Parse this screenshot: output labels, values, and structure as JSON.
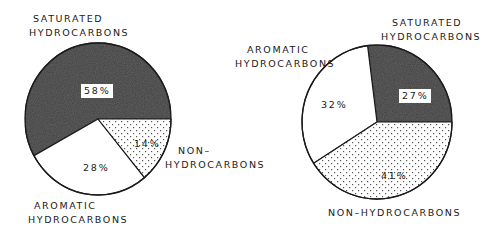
{
  "chart_data": [
    {
      "type": "pie",
      "title": "",
      "categories": [
        "Saturated Hydrocarbons",
        "Aromatic Hydrocarbons",
        "Non-Hydrocarbons"
      ],
      "values": [
        58,
        28,
        14
      ],
      "units": "%",
      "fills": [
        "dark-gray",
        "white",
        "dotted"
      ],
      "labels": {
        "saturated": [
          "SATURATED",
          "HYDROCARBONS"
        ],
        "aromatic": [
          "AROMATIC",
          "HYDROCARBONS"
        ],
        "non": [
          "NON–",
          "HYDROCARBONS"
        ]
      },
      "value_labels": [
        "58%",
        "28%",
        "14%"
      ],
      "legend": "none (direct labels)"
    },
    {
      "type": "pie",
      "title": "",
      "categories": [
        "Saturated Hydrocarbons",
        "Aromatic Hydrocarbons",
        "Non-Hydrocarbons"
      ],
      "values": [
        27,
        32,
        41
      ],
      "units": "%",
      "fills": [
        "dark-gray",
        "white",
        "dotted"
      ],
      "labels": {
        "saturated": [
          "SATURATED",
          "HYDROCARBONS"
        ],
        "aromatic": [
          "AROMATIC",
          "HYDROCARBONS"
        ],
        "non": [
          "NON–HYDROCARBONS"
        ]
      },
      "value_labels": [
        "27%",
        "32%",
        "41%"
      ],
      "legend": "none (direct labels)"
    }
  ],
  "colors": {
    "saturated": "#3f3f3f",
    "aromatic": "#ffffff",
    "non_bg": "#ffffff",
    "non_dot": "#555555",
    "outline": "#1a1a1a"
  }
}
